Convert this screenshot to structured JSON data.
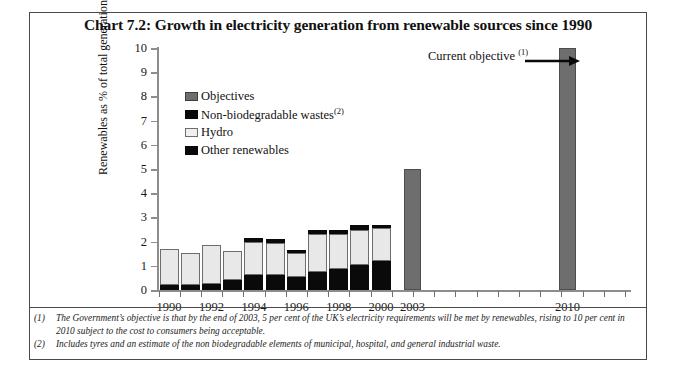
{
  "chart_data": {
    "type": "bar",
    "title": "Chart 7.2: Growth in electricity generation from renewable sources since 1990",
    "xlabel": "",
    "ylabel": "Renewables as % of total generation",
    "ylim": [
      0,
      10
    ],
    "ytick_labels": [
      "0",
      "1",
      "2",
      "3",
      "4",
      "5",
      "6",
      "7",
      "8",
      "9",
      "10"
    ],
    "xtick_labels": [
      "1990",
      "1992",
      "1994",
      "1996",
      "1998",
      "2000",
      "2003",
      "2010"
    ],
    "grid": false,
    "legend_position": "inside-upper-left",
    "categories": [
      "1990",
      "1991",
      "1992",
      "1993",
      "1994",
      "1995",
      "1996",
      "1997",
      "1998",
      "1999",
      "2000",
      "2003",
      "2010"
    ],
    "series": [
      {
        "name": "Other renewables",
        "color": "#0a0a0a",
        "values": [
          0.2,
          0.2,
          0.25,
          0.4,
          0.6,
          0.6,
          0.55,
          0.75,
          0.85,
          1.05,
          1.2,
          null,
          null
        ]
      },
      {
        "name": "Hydro",
        "color": "#e8e8e8",
        "values": [
          1.5,
          1.35,
          1.6,
          1.2,
          1.4,
          1.35,
          1.0,
          1.55,
          1.45,
          1.45,
          1.35,
          null,
          null
        ]
      },
      {
        "name": "Non-biodegradable wastes",
        "color": "#0a0a0a",
        "values": [
          0.0,
          0.0,
          0.0,
          0.0,
          0.15,
          0.15,
          0.1,
          0.2,
          0.2,
          0.2,
          0.15,
          null,
          null
        ]
      },
      {
        "name": "Objectives",
        "color": "#6e6e6e",
        "values": [
          null,
          null,
          null,
          null,
          null,
          null,
          null,
          null,
          null,
          null,
          null,
          5.0,
          10.0
        ]
      }
    ],
    "totals": [
      1.7,
      1.55,
      1.85,
      1.6,
      2.15,
      2.1,
      1.65,
      2.5,
      2.5,
      2.7,
      2.7,
      5.0,
      10.0
    ],
    "annotations": [
      {
        "text": "Current objective",
        "superscript": "(1)",
        "points_to": "2010"
      }
    ]
  },
  "legend": {
    "items": [
      {
        "label": "Objectives",
        "swatch": "objectives",
        "superscript": ""
      },
      {
        "label": "Non-biodegradable wastes",
        "swatch": "waste",
        "superscript": "(2)"
      },
      {
        "label": "Hydro",
        "swatch": "hydro",
        "superscript": ""
      },
      {
        "label": "Other renewables",
        "swatch": "other",
        "superscript": ""
      }
    ]
  },
  "annotation": {
    "label": "Current objective",
    "superscript": "(1)"
  },
  "footnotes": [
    {
      "num": "(1)",
      "text": "The Government’s objective is that by the end of 2003, 5 per cent of the UK’s electricity requirements will be  met by renewables, rising to 10 per cent in 2010 subject to the cost to consumers being acceptable."
    },
    {
      "num": "(2)",
      "text": "Includes tyres and an estimate of the non biodegradable elements of  municipal, hospital, and general industrial waste."
    }
  ],
  "colors": {
    "objectives": "#6e6e6e",
    "hydro": "#e8e8e8",
    "black": "#0a0a0a",
    "axis": "#8d8d8d",
    "border": "#4a4a4a"
  }
}
